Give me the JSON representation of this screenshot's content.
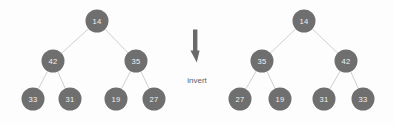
{
  "figure": {
    "background_color": "#fdfdfd",
    "node_color": "#6f6f6f",
    "node_text_color": "#f2f2f2",
    "edge_color": "#c9c9c9",
    "arrow_color": "#6a6a6a",
    "arrow_label_color": "#5d5d5d"
  },
  "chart_data": {
    "type": "diagram",
    "diagram_kind": "binary-tree-transformation",
    "operation_label": "invert",
    "trees": [
      {
        "name": "original-tree",
        "side": "left",
        "root": 14,
        "levels": [
          [
            14
          ],
          [
            42,
            35
          ],
          [
            33,
            31,
            19,
            27
          ]
        ],
        "nodes": [
          {
            "id": "L0",
            "value": "14",
            "cx": 97,
            "cy": 21,
            "r": 11.5
          },
          {
            "id": "L1L",
            "value": "42",
            "cx": 53,
            "cy": 61,
            "r": 11.5
          },
          {
            "id": "L1R",
            "value": "35",
            "cx": 136,
            "cy": 61,
            "r": 11.5
          },
          {
            "id": "L2A",
            "value": "33",
            "cx": 33,
            "cy": 99,
            "r": 11.5
          },
          {
            "id": "L2B",
            "value": "31",
            "cx": 70,
            "cy": 99,
            "r": 11.5
          },
          {
            "id": "L2C",
            "value": "19",
            "cx": 116,
            "cy": 99,
            "r": 11.5
          },
          {
            "id": "L2D",
            "value": "27",
            "cx": 154,
            "cy": 99,
            "r": 11.5
          }
        ],
        "edges": [
          {
            "from": "L0",
            "to": "L1L"
          },
          {
            "from": "L0",
            "to": "L1R"
          },
          {
            "from": "L1L",
            "to": "L2A"
          },
          {
            "from": "L1L",
            "to": "L2B"
          },
          {
            "from": "L1R",
            "to": "L2C"
          },
          {
            "from": "L1R",
            "to": "L2D"
          }
        ]
      },
      {
        "name": "inverted-tree",
        "side": "right",
        "root": 14,
        "levels": [
          [
            14
          ],
          [
            35,
            42
          ],
          [
            27,
            19,
            31,
            33
          ]
        ],
        "nodes": [
          {
            "id": "R0",
            "value": "14",
            "cx": 304,
            "cy": 21,
            "r": 11.5
          },
          {
            "id": "R1L",
            "value": "35",
            "cx": 262,
            "cy": 61,
            "r": 11.5
          },
          {
            "id": "R1R",
            "value": "42",
            "cx": 346,
            "cy": 61,
            "r": 11.5
          },
          {
            "id": "R2A",
            "value": "27",
            "cx": 240,
            "cy": 99,
            "r": 11.5
          },
          {
            "id": "R2B",
            "value": "19",
            "cx": 280,
            "cy": 99,
            "r": 11.5
          },
          {
            "id": "R2C",
            "value": "31",
            "cx": 324,
            "cy": 99,
            "r": 11.5
          },
          {
            "id": "R2D",
            "value": "33",
            "cx": 363,
            "cy": 99,
            "r": 11.5
          }
        ],
        "edges": [
          {
            "from": "R0",
            "to": "R1L"
          },
          {
            "from": "R0",
            "to": "R1R"
          },
          {
            "from": "R1L",
            "to": "R2A"
          },
          {
            "from": "R1L",
            "to": "R2B"
          },
          {
            "from": "R1R",
            "to": "R2C"
          },
          {
            "from": "R1R",
            "to": "R2D"
          }
        ]
      }
    ],
    "arrow": {
      "label": "invert",
      "label_x": 197,
      "label_y": 80,
      "cx": 196,
      "cy": 46
    }
  }
}
